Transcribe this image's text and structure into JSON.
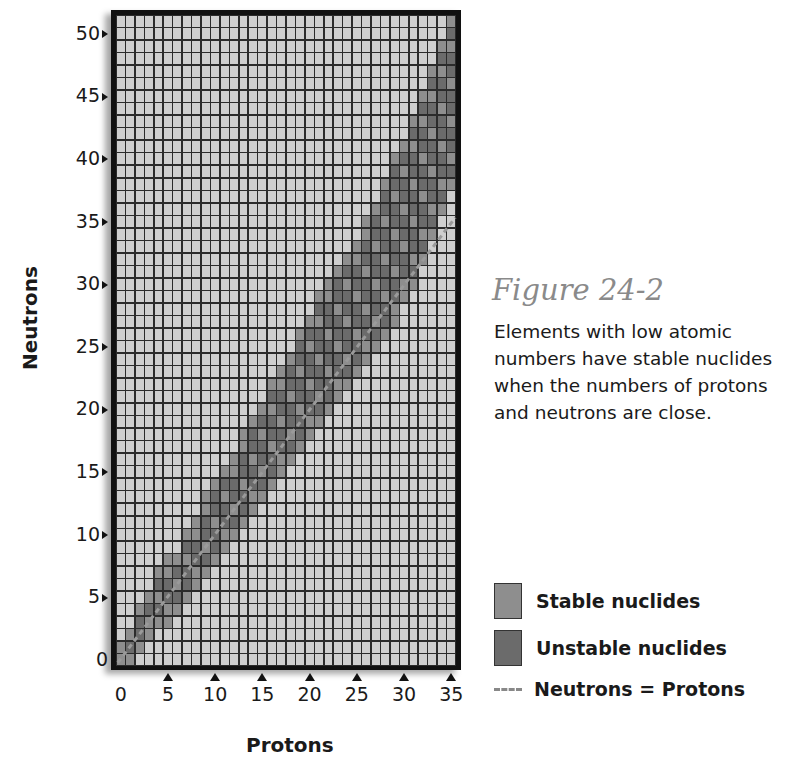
{
  "figure": {
    "title": "Figure 24-2",
    "caption": "Elements with low atomic numbers have stable nuclides when the numbers of protons and neutrons are close."
  },
  "legend": {
    "stable_label": "Stable nuclides",
    "unstable_label": "Unstable nuclides",
    "line_label": "Neutrons = Protons"
  },
  "axes": {
    "xlabel": "Protons",
    "ylabel": "Neutrons",
    "xticks": [
      "0",
      "5",
      "10",
      "15",
      "20",
      "25",
      "30",
      "35"
    ],
    "yticks": [
      "0",
      "5",
      "10",
      "15",
      "20",
      "25",
      "30",
      "35",
      "40",
      "45",
      "50"
    ]
  },
  "colors": {
    "background_cell": "#cfcfcf",
    "stable_cell": "#8e8e8e",
    "unstable_cell": "#6b6b6b",
    "grid_line": "#2b2b2b",
    "dash_line": "#9a9a9a",
    "title_gray": "#8a8a8a"
  },
  "chart_data": {
    "type": "heatmap",
    "title": "Figure 24-2",
    "xlabel": "Protons",
    "ylabel": "Neutrons",
    "xlim": [
      0,
      35
    ],
    "ylim": [
      0,
      51
    ],
    "grid": true,
    "legend": [
      "Stable nuclides",
      "Unstable nuclides",
      "Neutrons = Protons"
    ],
    "legend_position": "right",
    "reference_line": {
      "label": "Neutrons = Protons",
      "x": [
        0,
        35
      ],
      "y": [
        0,
        35
      ],
      "style": "dashed"
    },
    "band_columns": [
      {
        "protons": 0,
        "n_min": 0,
        "n_max": 1
      },
      {
        "protons": 1,
        "n_min": 0,
        "n_max": 2
      },
      {
        "protons": 2,
        "n_min": 1,
        "n_max": 4
      },
      {
        "protons": 3,
        "n_min": 2,
        "n_max": 5
      },
      {
        "protons": 4,
        "n_min": 3,
        "n_max": 7
      },
      {
        "protons": 5,
        "n_min": 3,
        "n_max": 8
      },
      {
        "protons": 6,
        "n_min": 4,
        "n_max": 8
      },
      {
        "protons": 7,
        "n_min": 5,
        "n_max": 10
      },
      {
        "protons": 8,
        "n_min": 6,
        "n_max": 11
      },
      {
        "protons": 9,
        "n_min": 7,
        "n_max": 13
      },
      {
        "protons": 10,
        "n_min": 8,
        "n_max": 14
      },
      {
        "protons": 11,
        "n_min": 9,
        "n_max": 15
      },
      {
        "protons": 12,
        "n_min": 10,
        "n_max": 16
      },
      {
        "protons": 13,
        "n_min": 11,
        "n_max": 18
      },
      {
        "protons": 14,
        "n_min": 12,
        "n_max": 19
      },
      {
        "protons": 15,
        "n_min": 13,
        "n_max": 20
      },
      {
        "protons": 16,
        "n_min": 14,
        "n_max": 22
      },
      {
        "protons": 17,
        "n_min": 15,
        "n_max": 23
      },
      {
        "protons": 18,
        "n_min": 16,
        "n_max": 24
      },
      {
        "protons": 19,
        "n_min": 17,
        "n_max": 26
      },
      {
        "protons": 20,
        "n_min": 18,
        "n_max": 27
      },
      {
        "protons": 21,
        "n_min": 19,
        "n_max": 29
      },
      {
        "protons": 22,
        "n_min": 20,
        "n_max": 30
      },
      {
        "protons": 23,
        "n_min": 21,
        "n_max": 31
      },
      {
        "protons": 24,
        "n_min": 22,
        "n_max": 32
      },
      {
        "protons": 25,
        "n_min": 23,
        "n_max": 33
      },
      {
        "protons": 26,
        "n_min": 24,
        "n_max": 35
      },
      {
        "protons": 27,
        "n_min": 25,
        "n_max": 36
      },
      {
        "protons": 28,
        "n_min": 26,
        "n_max": 38
      },
      {
        "protons": 29,
        "n_min": 27,
        "n_max": 40
      },
      {
        "protons": 30,
        "n_min": 29,
        "n_max": 41
      },
      {
        "protons": 31,
        "n_min": 30,
        "n_max": 43
      },
      {
        "protons": 32,
        "n_min": 32,
        "n_max": 45
      },
      {
        "protons": 33,
        "n_min": 34,
        "n_max": 47
      },
      {
        "protons": 34,
        "n_min": 36,
        "n_max": 49
      },
      {
        "protons": 35,
        "n_min": 38,
        "n_max": 51
      }
    ]
  }
}
